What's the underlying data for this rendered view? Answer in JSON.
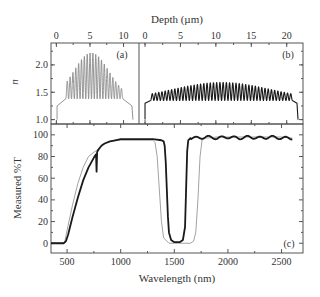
{
  "figure": {
    "top_xlabel": "Depth (µm)",
    "top_ylabel": "n",
    "bottom_xlabel": "Wavelength (nm)",
    "bottom_ylabel": "Measured %T",
    "panel_labels": [
      "(a)",
      "(b)",
      "(c)"
    ],
    "colors": {
      "frame": "#555555",
      "thick": "#1a1a1a",
      "thin": "#8a8a8a",
      "text": "#333333"
    }
  },
  "chart_data": [
    {
      "panel": "(a)",
      "type": "line",
      "title": "",
      "xlabel": "Depth (µm)",
      "ylabel": "n",
      "xlim": [
        -0.8,
        12.3
      ],
      "ylim": [
        0.92,
        2.4
      ],
      "xticks": [
        0,
        5,
        10
      ],
      "yticks": [
        1.0,
        1.5,
        2.0
      ],
      "description": "Rugate refractive-index profile, ~20 oscillations between base n≈1.38 and a Gaussian-apodized peak up to n≈2.22 near depth ≈5.2 µm; ramps 1.0→1.25→1.4 at ends",
      "profile": {
        "start_depth": 0.1,
        "end_depth": 11.4,
        "edge_n": 1.25,
        "base_n": 1.38,
        "osc_start": 1.4,
        "osc_end": 9.9,
        "peak_n": 2.22,
        "peak_depth": 5.2,
        "envelope_sigma": 2.6,
        "cycles": 20
      }
    },
    {
      "panel": "(b)",
      "type": "line",
      "title": "",
      "xlabel": "Depth (µm)",
      "ylabel": "n",
      "xlim": [
        -0.85,
        22.3
      ],
      "ylim": [
        0.92,
        2.4
      ],
      "xticks": [
        0,
        5,
        10,
        15,
        20
      ],
      "yticks": [
        1.0,
        1.5,
        2.0
      ],
      "description": "Rugate refractive-index profile, ~44 oscillations between base n≈1.35 and apodized peak up to n≈1.68 near depth ≈10.8 µm",
      "profile": {
        "start_depth": 0.0,
        "end_depth": 21.6,
        "edge_n": 1.3,
        "base_n": 1.35,
        "osc_start": 0.8,
        "osc_end": 20.8,
        "peak_n": 1.68,
        "peak_depth": 10.8,
        "envelope_sigma": 7.0,
        "cycles": 44
      }
    },
    {
      "panel": "(c)",
      "type": "line",
      "title": "",
      "xlabel": "Wavelength (nm)",
      "ylabel": "Measured %T",
      "xlim": [
        350,
        2700
      ],
      "ylim": [
        -9,
        110
      ],
      "xticks": [
        500,
        1000,
        1500,
        2000,
        2500
      ],
      "yticks": [
        0,
        20,
        40,
        60,
        80,
        100
      ],
      "series": [
        {
          "name": "thin (gray)",
          "style": "thin",
          "x": [
            350,
            460,
            480,
            500,
            550,
            600,
            650,
            700,
            750,
            780,
            800,
            850,
            900,
            950,
            1000,
            1100,
            1200,
            1300,
            1320,
            1340,
            1360,
            1380,
            1400,
            1450,
            1500,
            1550,
            1600,
            1650,
            1680,
            1700,
            1720,
            1740,
            1760,
            1800,
            1900,
            2000,
            2100,
            2200,
            2300,
            2400,
            2500,
            2600
          ],
          "y": [
            0,
            0,
            2,
            12,
            35,
            55,
            70,
            80,
            84,
            86,
            88,
            92,
            94,
            95,
            95,
            95,
            95,
            95,
            93,
            80,
            50,
            20,
            5,
            0,
            0,
            0,
            0,
            0,
            2,
            10,
            40,
            80,
            96,
            97,
            98,
            98,
            98,
            98,
            98,
            98,
            98,
            97
          ]
        },
        {
          "name": "thick (black)",
          "style": "thick",
          "x": [
            350,
            470,
            490,
            510,
            550,
            600,
            650,
            700,
            750,
            770,
            775,
            780,
            790,
            820,
            850,
            900,
            950,
            1000,
            1100,
            1200,
            1300,
            1380,
            1400,
            1410,
            1420,
            1430,
            1440,
            1450,
            1470,
            1500,
            1550,
            1580,
            1600,
            1610,
            1620,
            1630,
            1650,
            1700,
            1800,
            1900,
            2000,
            2100,
            2200,
            2300,
            2400,
            2500,
            2600
          ],
          "y": [
            0,
            0,
            2,
            8,
            24,
            42,
            58,
            70,
            79,
            82,
            66,
            84,
            86,
            90,
            92,
            94,
            95,
            96,
            96,
            96,
            96,
            95,
            94,
            90,
            75,
            50,
            25,
            10,
            3,
            1,
            1,
            3,
            15,
            50,
            85,
            95,
            97,
            97,
            98,
            97,
            98,
            97,
            98,
            97,
            98,
            97,
            97
          ]
        }
      ],
      "notes": "Thick curve shows ~±1.5% ripple above 1650 nm; both curves show a stop band near 1500–1600 nm"
    }
  ]
}
